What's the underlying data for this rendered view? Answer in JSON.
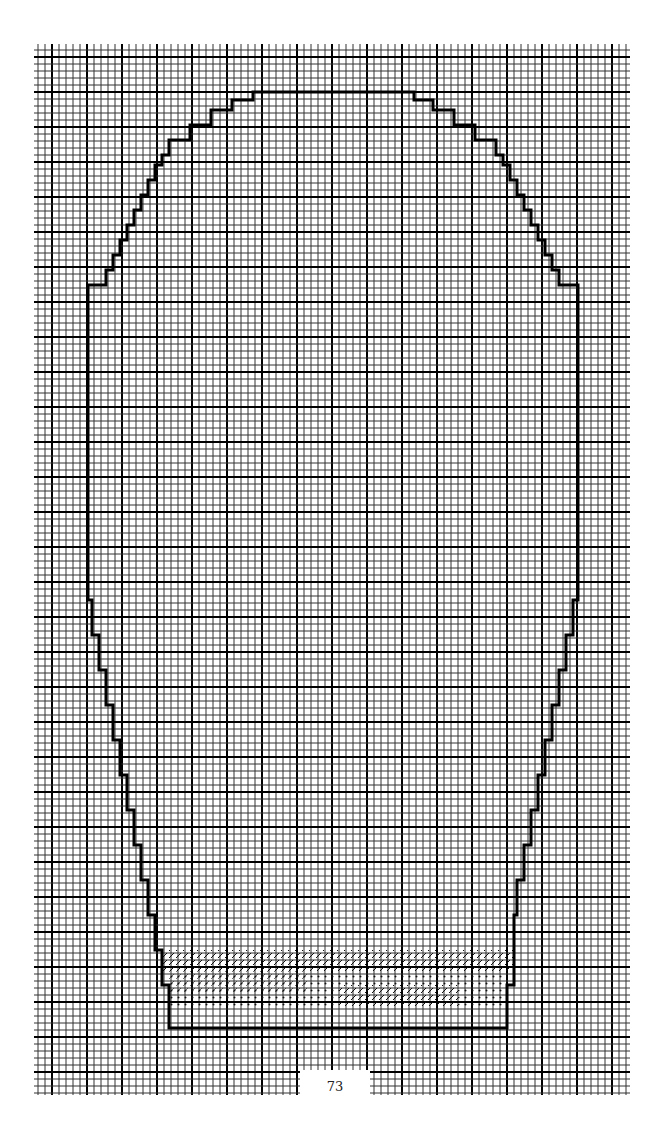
{
  "page": {
    "number": "73"
  },
  "chart_data": {
    "type": "diagram",
    "grid": {
      "origin_x": 34,
      "origin_y": 44,
      "cell": 7.0,
      "cols": 85,
      "rows": 150,
      "major_every": 5
    },
    "outline_points": [
      [
        33,
        35
      ],
      [
        33,
        33
      ],
      [
        32,
        33
      ],
      [
        32,
        32
      ],
      [
        31,
        32
      ],
      [
        31,
        31
      ],
      [
        30,
        31
      ],
      [
        30,
        30
      ],
      [
        29,
        30
      ],
      [
        29,
        29
      ],
      [
        28,
        29
      ],
      [
        28,
        28
      ],
      [
        27,
        28
      ],
      [
        27,
        27
      ],
      [
        26,
        27
      ],
      [
        26,
        26
      ],
      [
        25,
        26
      ],
      [
        25,
        24
      ],
      [
        24,
        24
      ],
      [
        24,
        22
      ],
      [
        23,
        22
      ],
      [
        23,
        21
      ],
      [
        22,
        21
      ],
      [
        22,
        20
      ],
      [
        19,
        20
      ],
      [
        19,
        19
      ],
      [
        16,
        19
      ],
      [
        16,
        18
      ],
      [
        13,
        18
      ],
      [
        13,
        17
      ],
      [
        10,
        17
      ],
      [
        10,
        19
      ],
      [
        9,
        19
      ],
      [
        9,
        20
      ],
      [
        7,
        20
      ],
      [
        7,
        21
      ],
      [
        6,
        21
      ],
      [
        6,
        22
      ],
      [
        5,
        22
      ],
      [
        5,
        24
      ],
      [
        4,
        24
      ],
      [
        4,
        26
      ],
      [
        3,
        26
      ],
      [
        3,
        27
      ],
      [
        2,
        27
      ],
      [
        2,
        28
      ],
      [
        1,
        28
      ],
      [
        1,
        29
      ],
      [
        0,
        29
      ],
      [
        0,
        30
      ]
    ],
    "colors": {
      "grid": "#1a1a1a",
      "outline": "#000000"
    }
  }
}
